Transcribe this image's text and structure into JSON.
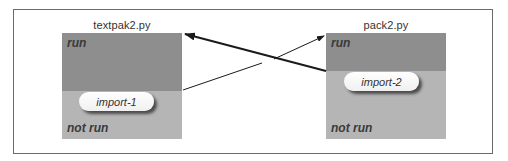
{
  "diagram": {
    "modules": [
      {
        "title": "textpak2.py",
        "run_label": "run",
        "not_run_label": "not run",
        "import_label": "import-1"
      },
      {
        "title": "pack2.py",
        "run_label": "run",
        "not_run_label": "not run",
        "import_label": "import-2"
      }
    ],
    "arrows": [
      {
        "from": "textpak2.py import-1 boundary",
        "to": "pack2.py top",
        "style": "thin"
      },
      {
        "from": "pack2.py import-2 boundary",
        "to": "textpak2.py top",
        "style": "thick"
      }
    ],
    "colors": {
      "run": "#8e8e8e",
      "not_run": "#b5b5b5",
      "pill": "#ffffff",
      "arrow": "#1a1a1a"
    }
  }
}
